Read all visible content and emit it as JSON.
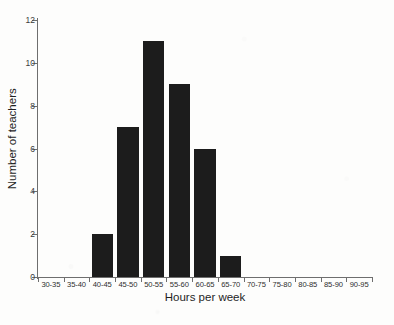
{
  "chart_data": {
    "type": "bar",
    "title": "",
    "xlabel": "Hours per week",
    "ylabel": "Number of teachers",
    "categories": [
      "30-35",
      "35-40",
      "40-45",
      "45-50",
      "50-55",
      "55-60",
      "60-65",
      "65-70",
      "70-75",
      "75-80",
      "80-85",
      "85-90",
      "90-95"
    ],
    "values": [
      0,
      0,
      2,
      7,
      11,
      9,
      6,
      1,
      0,
      0,
      0,
      0,
      0
    ],
    "ylim": [
      0,
      12
    ],
    "y_ticks": [
      0,
      2,
      4,
      6,
      8,
      10,
      12
    ],
    "grid": false,
    "legend": false,
    "bar_color": "#1c1c1c",
    "axis_color": "#6e6e6e"
  },
  "figure": {
    "caption": ""
  }
}
